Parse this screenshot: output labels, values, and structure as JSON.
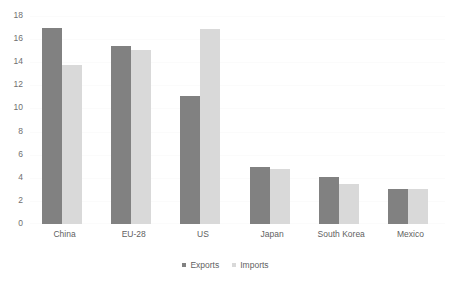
{
  "chart_data": {
    "type": "bar",
    "title": "",
    "subtitle": "",
    "xlabel": "",
    "ylabel": "",
    "categories": [
      "China",
      "EU-28",
      "US",
      "Japan",
      "South Korea",
      "Mexico"
    ],
    "series": [
      {
        "name": "Exports",
        "color": "#818181",
        "values": [
          17.0,
          15.4,
          11.1,
          4.9,
          4.1,
          3.0
        ]
      },
      {
        "name": "Imports",
        "color": "#d9d9d9",
        "values": [
          13.8,
          15.1,
          16.9,
          4.8,
          3.5,
          3.0
        ]
      }
    ],
    "ylim": [
      0,
      18
    ],
    "ytick_step": 2,
    "yticks": [
      "18",
      "16",
      "14",
      "12",
      "10",
      "8",
      "6",
      "4",
      "2",
      "0"
    ],
    "grid": false,
    "legend_position": "bottom-center",
    "background_color": "#ffffff"
  }
}
